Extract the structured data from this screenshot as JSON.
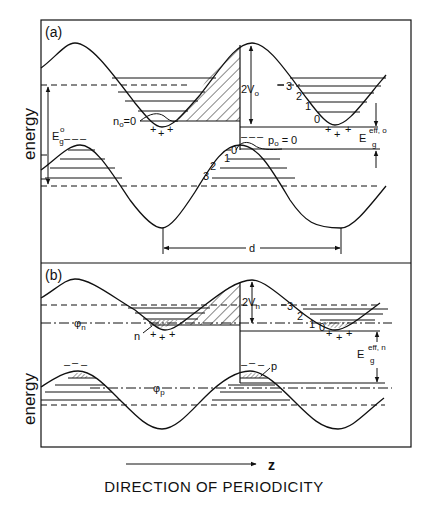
{
  "figure": {
    "caption": "DIRECTION OF PERIODICITY",
    "axis_arrow_label": "z",
    "y_axis_label": "energy"
  },
  "panel_a": {
    "label": "(a)",
    "y_label": "energy",
    "gap_label_main": "E",
    "gap_label_sub": "g",
    "gap_label_sup": "o",
    "amplitude_label": "2V",
    "amplitude_sub": "o",
    "electron_fermi_label": "n",
    "electron_fermi_sub": "o",
    "electron_fermi_value": "=0",
    "hole_fermi_label": "p",
    "hole_fermi_sub": "o",
    "hole_fermi_value": " = 0",
    "eff_gap_main": "E",
    "eff_gap_sub": "g",
    "eff_gap_sup": "eff, o",
    "period_label": "d",
    "conduction_subband_labels": [
      "3",
      "2",
      "1",
      "0"
    ],
    "valence_subband_labels": [
      "0",
      "1",
      "2",
      "3"
    ],
    "charge_plus": "+",
    "charge_minus": "–"
  },
  "panel_b": {
    "label": "(b)",
    "y_label": "energy",
    "amplitude_label": "2V",
    "amplitude_sub": "n",
    "quasi_fermi_n": "φ",
    "quasi_fermi_n_sub": "n",
    "quasi_fermi_p": "φ",
    "quasi_fermi_p_sub": "p",
    "electron_label": "n",
    "hole_label": "p",
    "eff_gap_main": "E",
    "eff_gap_sub": "g",
    "eff_gap_sup": "eff, n",
    "conduction_subband_labels": [
      "3",
      "2",
      "1",
      "0"
    ],
    "charge_plus": "+",
    "charge_minus": "–"
  }
}
